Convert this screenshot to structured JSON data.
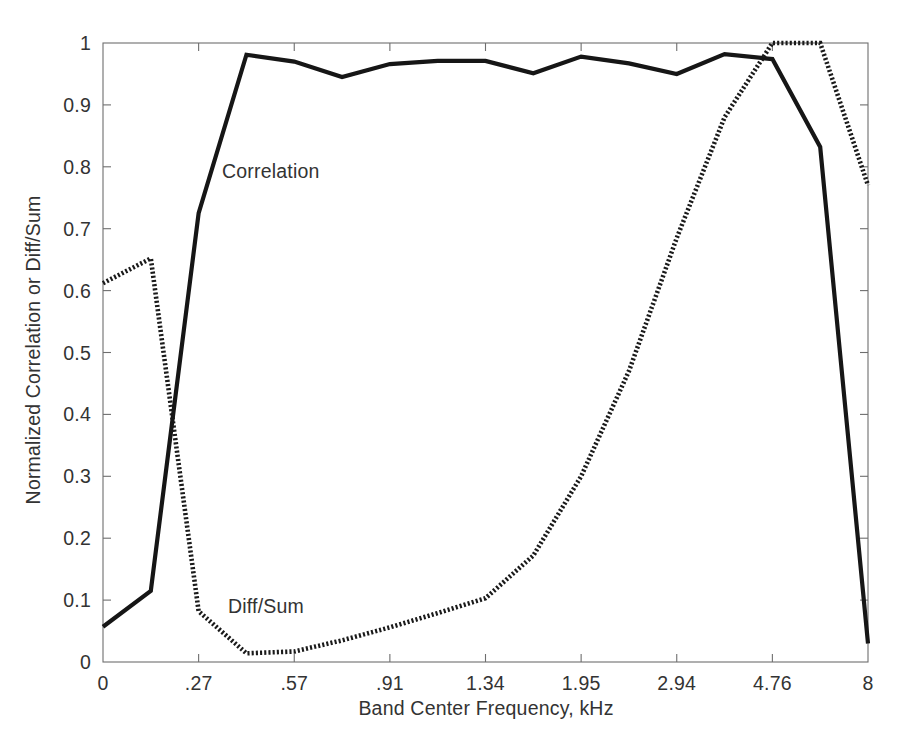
{
  "chart_data": {
    "type": "line",
    "title": "",
    "xlabel": "Band Center Frequency, kHz",
    "ylabel": "Normalized Correlation or Diff/Sum",
    "x_tick_labels": [
      "0",
      ".27",
      ".57",
      ".91",
      "1.34",
      "1.95",
      "2.94",
      "4.76",
      "8"
    ],
    "x_tick_values": [
      0,
      0.27,
      0.57,
      0.91,
      1.34,
      1.95,
      2.94,
      4.76,
      8
    ],
    "y_tick_labels": [
      "0",
      "0.1",
      "0.2",
      "0.3",
      "0.4",
      "0.5",
      "0.6",
      "0.7",
      "0.8",
      "0.9",
      "1"
    ],
    "y_tick_values": [
      0,
      0.1,
      0.2,
      0.3,
      0.4,
      0.5,
      0.6,
      0.7,
      0.8,
      0.9,
      1
    ],
    "ylim": [
      0,
      1
    ],
    "xlim": [
      0,
      8
    ],
    "x_scale": "ordinal-band",
    "grid": false,
    "legend": "inline-annotation",
    "annotations": [
      {
        "text": "Correlation",
        "x_px": 222,
        "y_px": 160
      },
      {
        "text": "Diff/Sum",
        "x_px": 228,
        "y_px": 595
      }
    ],
    "series": [
      {
        "name": "Correlation",
        "style": "solid",
        "color": "#161616",
        "x_index": [
          0,
          0.5,
          1.0,
          1.5,
          2.0,
          2.5,
          3.0,
          3.5,
          4.0,
          4.5,
          5.0,
          5.5,
          6.0,
          6.5,
          7.0,
          7.5,
          8.0
        ],
        "x_labels": [
          "0",
          "",
          ".27",
          "",
          ".57",
          "",
          ".91",
          "",
          "1.34",
          "",
          "1.95",
          "",
          "2.94",
          "",
          "4.76",
          "",
          "8"
        ],
        "values": [
          0.057,
          0.115,
          0.725,
          0.981,
          0.97,
          0.945,
          0.966,
          0.971,
          0.971,
          0.951,
          0.978,
          0.967,
          0.95,
          0.982,
          0.974,
          0.832,
          0.03
        ]
      },
      {
        "name": "Diff/Sum",
        "style": "dotted",
        "color": "#1a1a1a",
        "x_index": [
          0,
          0.5,
          1.0,
          1.5,
          2.0,
          2.5,
          3.0,
          3.5,
          4.0,
          4.5,
          5.0,
          5.5,
          6.0,
          6.5,
          7.0,
          7.5,
          8.0
        ],
        "x_labels": [
          "0",
          "",
          ".27",
          "",
          ".57",
          "",
          ".91",
          "",
          "1.34",
          "",
          "1.95",
          "",
          "2.94",
          "",
          "4.76",
          "",
          "8"
        ],
        "values": [
          0.612,
          0.652,
          0.082,
          0.014,
          0.017,
          0.035,
          0.056,
          0.079,
          0.103,
          0.172,
          0.3,
          0.47,
          0.685,
          0.88,
          1.0,
          1.0,
          0.77
        ]
      }
    ]
  },
  "axes": {
    "x_title": "Band Center Frequency, kHz",
    "y_title": "Normalized Correlation or Diff/Sum"
  }
}
